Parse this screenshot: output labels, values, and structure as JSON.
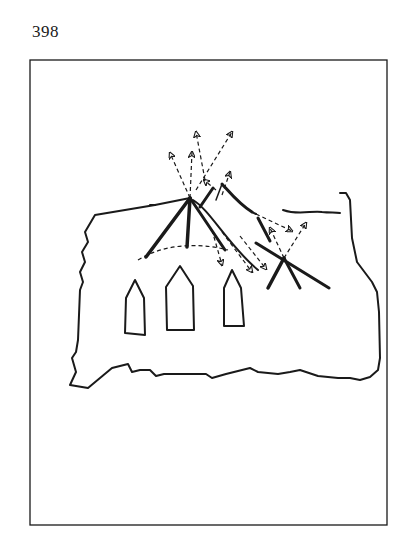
{
  "page": {
    "number": "398"
  },
  "figure": {
    "colors": {
      "ink": "#1a1a1a",
      "background": "#ffffff"
    },
    "windows_count": 3,
    "apex_points": [
      {
        "x": 190,
        "y": 198
      },
      {
        "x": 284,
        "y": 258
      }
    ]
  }
}
